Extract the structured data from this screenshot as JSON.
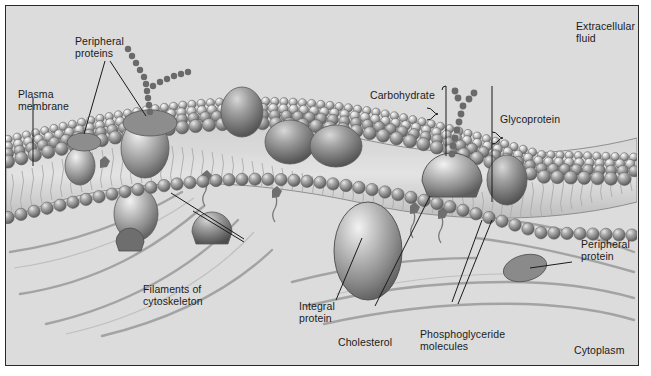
{
  "figure": {
    "kind": "biology-diagram",
    "background_color": "#dcdcdc",
    "ink_color": "#1b1b1b",
    "frame_color": "#2a2a2a"
  },
  "labels": {
    "peripheral_proteins_top": "Peripheral\nproteins",
    "plasma_membrane": "Plasma\nmembrane",
    "carbohydrate": "Carbohydrate",
    "glycoprotein": "Glycoprotein",
    "extracellular_fluid": "Extracellular\nfluid",
    "peripheral_protein_right": "Peripheral\nprotein",
    "filaments_of_cytoskeleton": "Filaments of\ncytoskeleton",
    "integral_protein": "Integral\nprotein",
    "cholesterol": "Cholesterol",
    "phosphoglyceride_molecules": "Phosphoglyceride\nmolecules",
    "cytoplasm": "Cytoplasm"
  },
  "structures": {
    "bilayer": "phospholipid bilayer with spherical polar heads and wavy hydrophobic tails",
    "integral_proteins": "ovoid proteins spanning the membrane",
    "peripheral_proteins": "ellipsoid proteins resting on the membrane surface",
    "glycoprotein": "dome protein bearing a branched beaded carbohydrate chain",
    "cholesterol": "small dark bodies wedged between phospholipid tails",
    "cytoskeleton": "curved filaments beneath the membrane in the cytoplasm"
  }
}
